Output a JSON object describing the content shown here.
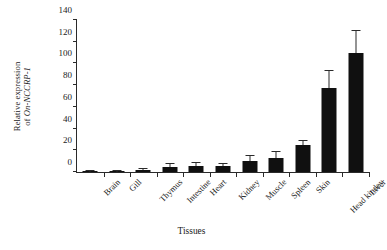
{
  "chart_data": {
    "type": "bar",
    "title": "",
    "xlabel": "Tissues",
    "ylabel_line1": "Relative expression",
    "ylabel_line2_prefix": "of ",
    "ylabel_line2_italic": "On-NCCRP-1",
    "ylabel": "Relative expression of On-NCCRP-1",
    "categories": [
      "Brain",
      "Gill",
      "Thymus",
      "Intestine",
      "Heart",
      "Kidney",
      "Muscle",
      "Spleen",
      "Skin",
      "Head kindey",
      "Liver"
    ],
    "values": [
      0.5,
      0.5,
      2,
      5,
      6,
      6,
      10.5,
      12.5,
      24.5,
      77,
      110
    ],
    "errors": [
      0.3,
      0.3,
      0.5,
      2.5,
      2,
      1.5,
      4.5,
      6,
      4,
      16,
      20
    ],
    "ylim": [
      0,
      140
    ],
    "yticks": [
      0,
      20,
      40,
      60,
      80,
      100,
      120,
      140
    ],
    "ytick_step": 20,
    "grid": false,
    "legend": "none",
    "bar_color": "#101010",
    "axis_color": "#2a2a2a",
    "background": "#ffffff"
  }
}
